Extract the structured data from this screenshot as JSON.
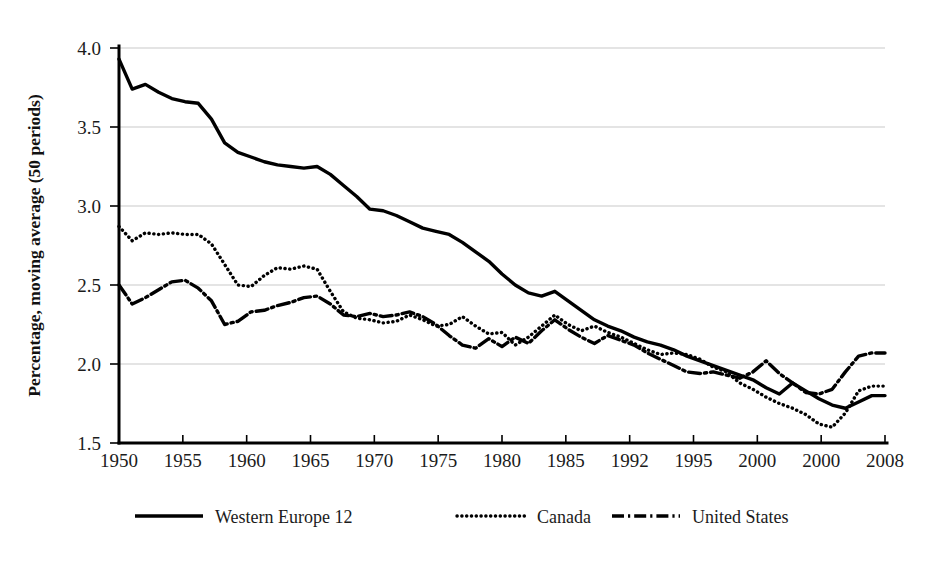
{
  "figure": {
    "background_color": "#ffffff",
    "ink_color": "#000000",
    "grid_color": "#c9c9c9"
  },
  "axes": {
    "ylabel": "Percentage, moving average (50 periods)",
    "xlabel": "",
    "y_ticks": [
      "1.5",
      "2.0",
      "2.5",
      "3.0",
      "3.5",
      "4.0"
    ],
    "x_ticks": [
      "1950",
      "1955",
      "1960",
      "1965",
      "1970",
      "1975",
      "1980",
      "1985",
      "1992",
      "1995",
      "2000",
      "2000",
      "2008"
    ]
  },
  "legend": {
    "position": "below-axes",
    "entries": [
      {
        "label": "Western Europe 12",
        "style": "solid"
      },
      {
        "label": "Canada",
        "style": "dotted"
      },
      {
        "label": "United States",
        "style": "dash-dot"
      }
    ]
  },
  "chart_data": {
    "type": "line",
    "title": "",
    "xlabel": "",
    "ylabel": "Percentage, moving average (50 periods)",
    "xlim": [
      1950,
      2008
    ],
    "ylim": [
      1.5,
      4.0
    ],
    "grid": true,
    "y_tick_values": [
      1.5,
      2.0,
      2.5,
      3.0,
      3.5,
      4.0
    ],
    "x_tick_labels": [
      "1950",
      "1955",
      "1960",
      "1965",
      "1970",
      "1975",
      "1980",
      "1985",
      "1992",
      "1995",
      "2000",
      "2000",
      "2008"
    ],
    "x": [
      1950,
      1951,
      1952,
      1953,
      1954,
      1955,
      1956,
      1957,
      1958,
      1959,
      1960,
      1961,
      1962,
      1963,
      1964,
      1965,
      1966,
      1967,
      1968,
      1969,
      1970,
      1971,
      1972,
      1973,
      1974,
      1975,
      1976,
      1977,
      1978,
      1979,
      1980,
      1981,
      1982,
      1983,
      1984,
      1985,
      1986,
      1987,
      1988,
      1989,
      1990,
      1991,
      1992,
      1993,
      1994,
      1995,
      1996,
      1997,
      1998,
      1999,
      2000,
      2001,
      2002,
      2003,
      2004,
      2005,
      2006,
      2007,
      2008
    ],
    "series": [
      {
        "name": "Western Europe 12",
        "style": "solid",
        "values": [
          3.93,
          3.74,
          3.77,
          3.72,
          3.68,
          3.66,
          3.65,
          3.55,
          3.4,
          3.34,
          3.31,
          3.28,
          3.26,
          3.25,
          3.24,
          3.25,
          3.2,
          3.13,
          3.06,
          2.98,
          2.97,
          2.94,
          2.9,
          2.86,
          2.84,
          2.82,
          2.77,
          2.71,
          2.65,
          2.57,
          2.5,
          2.45,
          2.43,
          2.46,
          2.4,
          2.34,
          2.28,
          2.24,
          2.21,
          2.17,
          2.14,
          2.12,
          2.09,
          2.05,
          2.02,
          1.99,
          1.96,
          1.93,
          1.9,
          1.85,
          1.81,
          1.88,
          1.83,
          1.78,
          1.74,
          1.72,
          1.76,
          1.8,
          1.8
        ]
      },
      {
        "name": "Canada",
        "style": "dotted",
        "values": [
          2.87,
          2.78,
          2.83,
          2.82,
          2.83,
          2.82,
          2.82,
          2.76,
          2.63,
          2.5,
          2.49,
          2.56,
          2.61,
          2.6,
          2.62,
          2.6,
          2.46,
          2.33,
          2.29,
          2.28,
          2.26,
          2.27,
          2.31,
          2.28,
          2.24,
          2.25,
          2.3,
          2.24,
          2.19,
          2.2,
          2.12,
          2.17,
          2.24,
          2.31,
          2.25,
          2.21,
          2.24,
          2.2,
          2.17,
          2.13,
          2.09,
          2.06,
          2.07,
          2.06,
          2.03,
          1.98,
          1.95,
          1.88,
          1.84,
          1.79,
          1.75,
          1.72,
          1.68,
          1.62,
          1.6,
          1.69,
          1.83,
          1.86,
          1.86
        ]
      },
      {
        "name": "United States",
        "style": "dash-dot",
        "values": [
          2.5,
          2.38,
          2.42,
          2.47,
          2.52,
          2.53,
          2.48,
          2.4,
          2.25,
          2.27,
          2.33,
          2.34,
          2.37,
          2.39,
          2.42,
          2.43,
          2.38,
          2.31,
          2.3,
          2.32,
          2.3,
          2.31,
          2.33,
          2.3,
          2.25,
          2.18,
          2.12,
          2.1,
          2.16,
          2.11,
          2.17,
          2.13,
          2.21,
          2.28,
          2.22,
          2.17,
          2.13,
          2.18,
          2.15,
          2.12,
          2.07,
          2.03,
          1.99,
          1.95,
          1.94,
          1.95,
          1.93,
          1.91,
          1.95,
          2.02,
          1.94,
          1.88,
          1.82,
          1.81,
          1.84,
          1.95,
          2.05,
          2.07,
          2.07
        ]
      }
    ]
  }
}
